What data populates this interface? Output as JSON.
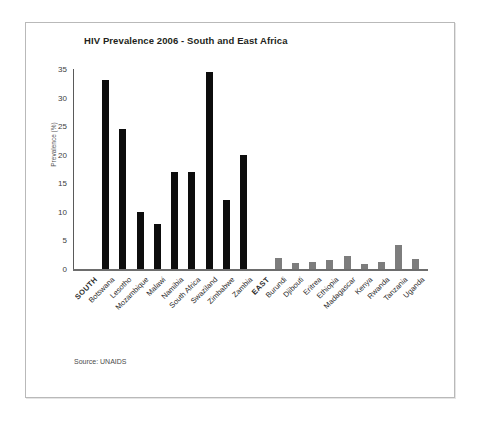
{
  "chart_data": {
    "type": "bar",
    "title": "HIV Prevalence 2006 - South and East Africa",
    "xlabel": "",
    "ylabel": "Prevalence (%)",
    "ylim": [
      0,
      35
    ],
    "yticks": [
      0,
      5,
      10,
      15,
      20,
      25,
      30,
      35
    ],
    "grid": false,
    "legend": "none",
    "source": "Source: UNAIDS",
    "categories": [
      "SOUTH",
      "Botswana",
      "Lesotho",
      "Mozambique",
      "Malawi",
      "Namibia",
      "South Africa",
      "Swaziland",
      "Zimbabwe",
      "Zambia",
      "EAST",
      "Burundi",
      "Djibouti",
      "Eritrea",
      "Ethiopia",
      "Madagascar",
      "Kenya",
      "Rwanda",
      "Tanzania",
      "Uganda"
    ],
    "values": [
      null,
      33.0,
      24.5,
      9.9,
      7.9,
      17.0,
      17.0,
      34.5,
      12.1,
      20.0,
      null,
      2.0,
      1.1,
      1.2,
      1.5,
      2.2,
      0.8,
      1.3,
      4.2,
      1.7
    ],
    "groups": [
      {
        "name": "SOUTH",
        "color": "#0d0d0d",
        "categories": [
          "Botswana",
          "Lesotho",
          "Mozambique",
          "Malawi",
          "Namibia",
          "South Africa",
          "Swaziland",
          "Zimbabwe",
          "Zambia"
        ],
        "values": [
          33.0,
          24.5,
          9.9,
          7.9,
          17.0,
          17.0,
          34.5,
          12.1,
          20.0
        ]
      },
      {
        "name": "EAST",
        "color": "#7d7d7d",
        "categories": [
          "Burundi",
          "Djibouti",
          "Eritrea",
          "Ethiopia",
          "Madagascar",
          "Kenya",
          "Rwanda",
          "Tanzania",
          "Uganda"
        ],
        "values": [
          2.0,
          1.1,
          1.2,
          1.5,
          2.2,
          0.8,
          1.3,
          4.2,
          1.7
        ]
      }
    ]
  },
  "colors": {
    "south_bar": "#0d0d0d",
    "east_bar": "#7d7d7d",
    "axis": "#5a5a5a",
    "text": "#231f20",
    "frame": "#b9b9b9"
  }
}
